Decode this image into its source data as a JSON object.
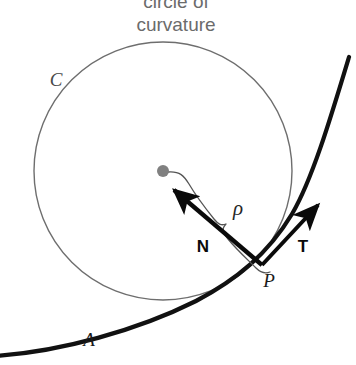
{
  "figure": {
    "title_line1": "circle of",
    "title_line2": "curvature",
    "labels": {
      "circle_label": "C",
      "curve_label": "A",
      "point_label": "P",
      "normal_label": "N",
      "tangent_label": "T",
      "radius_label": "ρ"
    },
    "colors": {
      "background": "#ffffff",
      "caption": "#6b6b6b",
      "circle_stroke": "#6e6e6e",
      "curve_stroke": "#111111",
      "vector_stroke": "#0a0a0a",
      "brace_stroke": "#555555",
      "center_dot": "#808080",
      "label_dark": "#1a1a1a"
    },
    "geometry": {
      "circle_center_x": 163,
      "circle_center_y": 171,
      "circle_radius": 129,
      "point_p_x": 262,
      "point_p_y": 265,
      "center_dot_radius": 6
    }
  }
}
